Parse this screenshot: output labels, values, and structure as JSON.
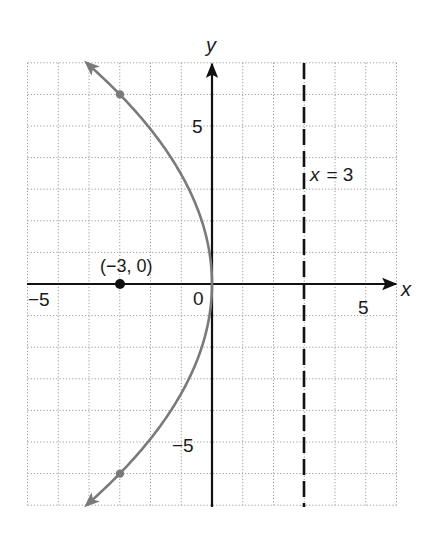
{
  "chart_data": {
    "type": "line",
    "title": "",
    "xlabel": "x",
    "ylabel": "y",
    "xlim": [
      -6,
      6
    ],
    "ylim": [
      -7,
      7
    ],
    "grid": true,
    "grid_style": "dotted",
    "x_ticks": [
      {
        "value": -5,
        "label": "−5"
      },
      {
        "value": 0,
        "label": "0"
      },
      {
        "value": 5,
        "label": "5"
      }
    ],
    "y_ticks": [
      {
        "value": 5,
        "label": "5"
      },
      {
        "value": -5,
        "label": "−5"
      }
    ],
    "series": [
      {
        "name": "parabola",
        "equation": "y^2 = -12x",
        "style": "solid",
        "color": "#7a7a7a",
        "arrows_at_ends": true,
        "y_range": [
          -7,
          7
        ],
        "points": [
          {
            "x": -4.08,
            "y": 7
          },
          {
            "x": -3,
            "y": 6
          },
          {
            "x": -2.08,
            "y": 5
          },
          {
            "x": -1.33,
            "y": 4
          },
          {
            "x": -0.75,
            "y": 3
          },
          {
            "x": -0.33,
            "y": 2
          },
          {
            "x": -0.08,
            "y": 1
          },
          {
            "x": 0,
            "y": 0
          },
          {
            "x": -0.08,
            "y": -1
          },
          {
            "x": -0.33,
            "y": -2
          },
          {
            "x": -0.75,
            "y": -3
          },
          {
            "x": -1.33,
            "y": -4
          },
          {
            "x": -2.08,
            "y": -5
          },
          {
            "x": -3,
            "y": -6
          },
          {
            "x": -4.08,
            "y": -7
          }
        ],
        "marked_points": [
          {
            "x": -3,
            "y": 6
          },
          {
            "x": -3,
            "y": -6
          }
        ]
      },
      {
        "name": "directrix",
        "label": "x = 3",
        "type": "vertical_line",
        "x": 3,
        "style": "dashed",
        "color": "#111111"
      }
    ],
    "annotations": [
      {
        "type": "point",
        "x": -3,
        "y": 0,
        "label": "(−3, 0)",
        "role": "focus",
        "color": "#111111"
      },
      {
        "type": "text",
        "text": "x = 3",
        "near_x": 3,
        "near_y": 3.5
      }
    ]
  },
  "labels": {
    "x_axis": "x",
    "y_axis": "y",
    "origin": "0",
    "x_tick_neg5": "−5",
    "x_tick_5": "5",
    "y_tick_5": "5",
    "y_tick_neg5": "−5",
    "focus_label": "(−3, 0)",
    "directrix_x": "x",
    "directrix_eq": "= 3"
  },
  "colors": {
    "grid": "#9a9a9a",
    "axes": "#111111",
    "curve": "#7a7a7a",
    "background": "#ffffff"
  }
}
